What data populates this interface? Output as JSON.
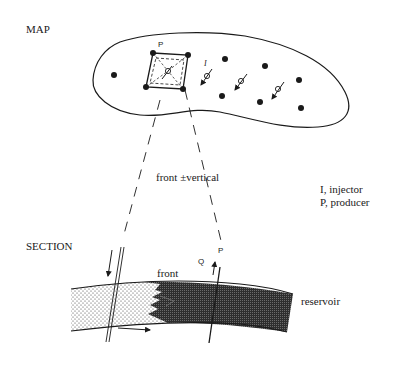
{
  "map": {
    "title": "MAP",
    "producer_label": "P",
    "injector_label": "I"
  },
  "section": {
    "title": "SECTION",
    "front_label": "front",
    "reservoir_label": "reservoir",
    "rate_label": "Q",
    "producer_label": "P"
  },
  "annotations": {
    "front_vertical": "front ±vertical"
  },
  "legend": {
    "items": [
      {
        "label": "I, injector"
      },
      {
        "label": "P, producer"
      }
    ]
  },
  "colors": {
    "ink": "#1a1a1a",
    "background": "#ffffff",
    "oil_zone": "#3a3a3a",
    "water_zone_dots": "#333333"
  }
}
